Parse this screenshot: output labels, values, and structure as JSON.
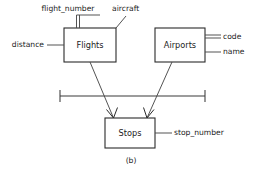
{
  "diagram": {
    "caption": "(b)",
    "entities": [
      {
        "id": "flights",
        "label": "Flights"
      },
      {
        "id": "airports",
        "label": "Airports"
      },
      {
        "id": "stops",
        "label": "Stops"
      }
    ],
    "attributes": [
      {
        "id": "flight-number",
        "label": "flight_number",
        "owner": "flights",
        "key": true,
        "line_style": "double"
      },
      {
        "id": "aircraft",
        "label": "aircraft",
        "owner": "flights",
        "key": false,
        "line_style": "single"
      },
      {
        "id": "distance",
        "label": "distance",
        "owner": "flights",
        "key": false,
        "line_style": "single"
      },
      {
        "id": "code",
        "label": "code",
        "owner": "airports",
        "key": true,
        "line_style": "double"
      },
      {
        "id": "name",
        "label": "name",
        "owner": "airports",
        "key": false,
        "line_style": "single"
      },
      {
        "id": "stop-number",
        "label": "stop_number",
        "owner": "stops",
        "key": false,
        "line_style": "single"
      }
    ],
    "relationships": [
      {
        "id": "flights-to-stops",
        "from": "flights",
        "to": "stops",
        "arrow": true
      },
      {
        "id": "airports-to-stops",
        "from": "airports",
        "to": "stops",
        "arrow": true
      }
    ],
    "colors": {
      "background": "#ffffff",
      "stroke": "#2b2b2b",
      "text": "#1c1c1c"
    }
  }
}
